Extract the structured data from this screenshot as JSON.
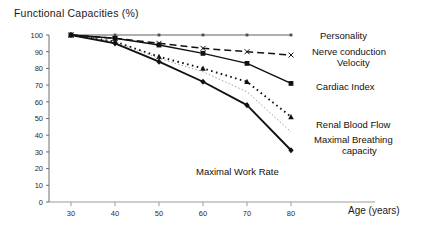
{
  "chart_data": {
    "type": "line",
    "title": "Functional  Capacities (%)",
    "xlabel": "Age (years)",
    "ylabel": "Functional  Capacities (%)",
    "x": [
      30,
      40,
      50,
      60,
      70,
      80
    ],
    "xlim": [
      25,
      85
    ],
    "ylim": [
      0,
      100
    ],
    "xticks": [
      "30",
      "40",
      "50",
      "60",
      "70",
      "80"
    ],
    "yticks": [
      "0",
      "10",
      "20",
      "30",
      "40",
      "50",
      "60",
      "70",
      "80",
      "90",
      "100"
    ],
    "grid": false,
    "legend_position": "right-inline-labels",
    "series": [
      {
        "name": "Personality",
        "values": [
          100,
          100,
          100,
          100,
          100,
          100
        ],
        "marker": "square-small",
        "line_style": "solid-thin",
        "color": "#4d4d4d"
      },
      {
        "name": "Nerve conduction Velocity",
        "values": [
          100,
          98,
          95,
          92,
          90,
          88
        ],
        "marker": "x",
        "line_style": "dashed",
        "color": "#111111"
      },
      {
        "name": "Cardiac Index",
        "values": [
          100,
          98,
          94,
          89,
          83,
          71
        ],
        "marker": "square",
        "line_style": "solid",
        "color": "#111111"
      },
      {
        "name": "Renal Blood Flow",
        "values": [
          100,
          96,
          87,
          80,
          72,
          51
        ],
        "marker": "triangle",
        "line_style": "dotted",
        "color": "#111111"
      },
      {
        "name": "Maximal Breathing capacity",
        "values": [
          100,
          96,
          86,
          78,
          66,
          42
        ],
        "marker": "none",
        "line_style": "fine-dotted",
        "color": "#8a8a8a"
      },
      {
        "name": "Maximal Work Rate",
        "values": [
          100,
          95,
          84,
          72,
          58,
          31
        ],
        "marker": "diamond",
        "line_style": "solid-thick",
        "color": "#111111"
      }
    ]
  },
  "labels": {
    "personality": "Personality",
    "nerve_line1": "Nerve conduction",
    "nerve_line2": "Velocity",
    "cardiac": "Cardiac Index",
    "renal": "Renal Blood Flow",
    "breathing_line1": "Maximal Breathing",
    "breathing_line2": "capacity",
    "work_rate": "Maximal Work Rate",
    "x_axis": "Age (years)"
  }
}
